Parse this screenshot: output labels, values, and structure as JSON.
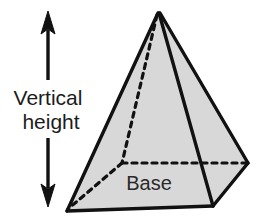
{
  "diagram": {
    "background_color": "#ffffff",
    "face_fill_color": "#d8d8d8",
    "edge_color": "#111111",
    "hidden_edge_color": "#111111",
    "text_color": "#1c1c1c"
  },
  "labels": {
    "vertical_height_line1": "Vertical",
    "vertical_height_line2": "height",
    "base": "Base"
  },
  "annotation": {
    "arrow_name": "double-headed vertical arrow",
    "arrow_top_tip_y": 13,
    "arrow_bottom_tip_y": 205,
    "arrow_x": 48
  },
  "geometry": {
    "apex": [
      158,
      13
    ],
    "front_left_vertex": [
      67,
      211
    ],
    "front_bottom_vertex": [
      213,
      206
    ],
    "right_vertex": [
      248,
      163
    ],
    "hidden_back_vertex": [
      122,
      163
    ]
  }
}
